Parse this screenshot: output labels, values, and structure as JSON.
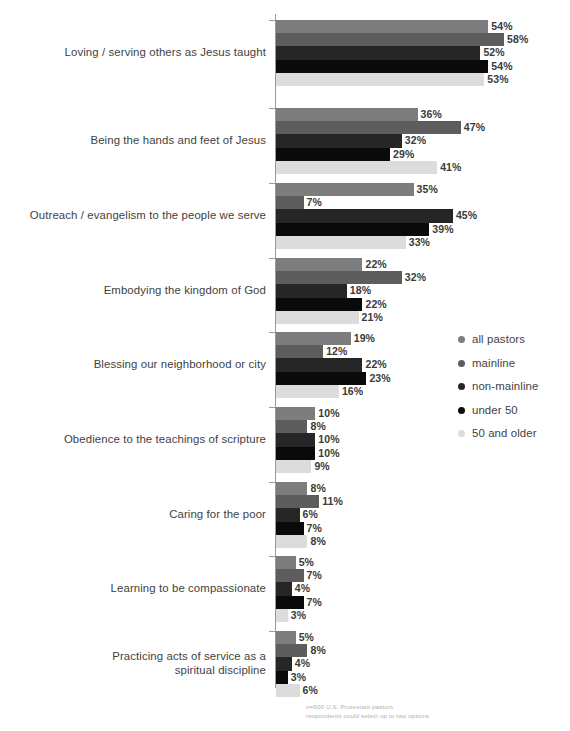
{
  "chart_data": {
    "type": "bar",
    "orientation": "horizontal",
    "title": "",
    "xlabel": "",
    "ylabel": "",
    "xlim": [
      0,
      60
    ],
    "grid": false,
    "legend_position": "right",
    "value_suffix": "%",
    "categories": [
      "Loving / serving others as Jesus taught",
      "Being the hands and feet of Jesus",
      "Outreach / evangelism to the people we serve",
      "Embodying the kingdom of God",
      "Blessing our neighborhood or city",
      "Obedience to the teachings of scripture",
      "Caring for the poor",
      "Learning to be compassionate",
      "Practicing acts of service as a\nspiritual discipline"
    ],
    "series": [
      {
        "name": "all pastors",
        "color": "#7d7d7d",
        "values": [
          54,
          36,
          35,
          22,
          19,
          10,
          8,
          5,
          5
        ]
      },
      {
        "name": "mainline",
        "color": "#5d5d5d",
        "values": [
          58,
          47,
          7,
          32,
          12,
          8,
          11,
          7,
          8
        ]
      },
      {
        "name": "non-mainline",
        "color": "#262626",
        "values": [
          52,
          32,
          45,
          18,
          22,
          10,
          6,
          4,
          4
        ]
      },
      {
        "name": "under 50",
        "color": "#0a0a0a",
        "values": [
          54,
          29,
          39,
          22,
          23,
          10,
          7,
          7,
          3
        ]
      },
      {
        "name": "50 and older",
        "color": "#dcdcdc",
        "values": [
          53,
          41,
          33,
          21,
          16,
          9,
          8,
          3,
          6
        ]
      }
    ],
    "value_labels": [
      [
        "54%",
        "58%",
        "52%",
        "54%",
        "53%"
      ],
      [
        "36%",
        "47%",
        "32%",
        "29%",
        "41%"
      ],
      [
        "35%",
        "7%",
        "45%",
        "39%",
        "33%"
      ],
      [
        "22%",
        "32%",
        "18%",
        "22%",
        "21%"
      ],
      [
        "19%",
        "12%",
        "22%",
        "23%",
        "16%"
      ],
      [
        "10%",
        "8%",
        "10%",
        "10%",
        "9%"
      ],
      [
        "8%",
        "11%",
        "6%",
        "7%",
        "8%"
      ],
      [
        "5%",
        "7%",
        "4%",
        "7%",
        "3%"
      ],
      [
        "5%",
        "8%",
        "4%",
        "3%",
        "6%"
      ]
    ]
  },
  "legend": {
    "items": [
      {
        "label": "all pastors",
        "color": "#7d7d7d"
      },
      {
        "label": "mainline",
        "color": "#5d5d5d"
      },
      {
        "label": "non-mainline",
        "color": "#262626"
      },
      {
        "label": "under 50",
        "color": "#0a0a0a"
      },
      {
        "label": "50 and older",
        "color": "#dcdcdc"
      }
    ]
  },
  "footnote": {
    "line1": "n=600 U.S. Protestant pastors",
    "line2": "respondents could select up to two options"
  },
  "axis": {
    "line_color": "#9b9b9b"
  }
}
